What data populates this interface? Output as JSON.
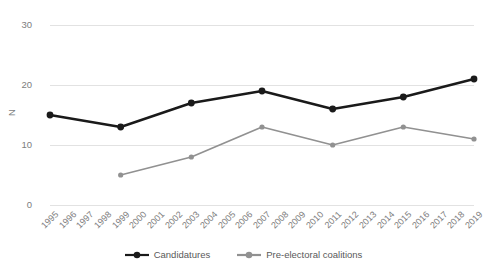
{
  "chart_data": {
    "type": "line",
    "title": "",
    "xlabel": "",
    "ylabel": "N",
    "ylim": [
      0,
      30
    ],
    "yticks": [
      0,
      10,
      20,
      30
    ],
    "grid": true,
    "legend_position": "bottom",
    "categories": [
      "1995",
      "1996",
      "1997",
      "1998",
      "1999",
      "2000",
      "2001",
      "2002",
      "2003",
      "2004",
      "2005",
      "2006",
      "2007",
      "2008",
      "2009",
      "2010",
      "2011",
      "2012",
      "2013",
      "2014",
      "2015",
      "2016",
      "2017",
      "2018",
      "2019"
    ],
    "marker_years": [
      1995,
      1999,
      2003,
      2007,
      2011,
      2015,
      2019
    ],
    "series": [
      {
        "name": "Candidatures",
        "color": "#1a1a1a",
        "x": [
          1995,
          1999,
          2003,
          2007,
          2011,
          2015,
          2019
        ],
        "values": [
          15,
          13,
          17,
          19,
          16,
          18,
          21
        ]
      },
      {
        "name": "Pre-electoral coalitions",
        "color": "#919191",
        "x": [
          1999,
          2003,
          2007,
          2011,
          2015,
          2019
        ],
        "values": [
          5,
          8,
          13,
          10,
          13,
          11
        ]
      }
    ]
  },
  "legend": {
    "entries": [
      {
        "label": "Candidatures",
        "color": "#1a1a1a"
      },
      {
        "label": "Pre-electoral coalitions",
        "color": "#919191"
      }
    ]
  },
  "colors": {
    "gridline": "#e2e2e2",
    "tick_text": "#7d7d7d",
    "legend_text": "#595959",
    "background": "#ffffff"
  }
}
